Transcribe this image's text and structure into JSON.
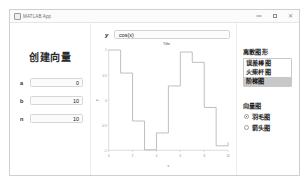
{
  "window": {
    "title": "MATLAB App",
    "icon": "app-icon",
    "controls": {
      "minimize": "–",
      "maximize": "□",
      "close": "✕"
    }
  },
  "left_panel": {
    "title": "创建向量",
    "fields": [
      {
        "label": "a",
        "value": "0"
      },
      {
        "label": "b",
        "value": "10"
      },
      {
        "label": "n",
        "value": "10"
      }
    ]
  },
  "center_panel": {
    "formula_label": "y",
    "formula_value": "cos(x)",
    "formula_placeholder": "cos(x)"
  },
  "right_panel": {
    "discrete_group": {
      "title": "离散图形",
      "items": [
        {
          "label": "误差棒图",
          "selected": false
        },
        {
          "label": "火柴杆图",
          "selected": false
        },
        {
          "label": "阶梯图",
          "selected": true
        }
      ]
    },
    "vector_group": {
      "title": "向量图",
      "options": [
        {
          "label": "羽毛图",
          "checked": true
        },
        {
          "label": "箭头图",
          "checked": false
        }
      ]
    }
  },
  "chart_data": {
    "type": "line",
    "title": "Title",
    "xlabel": "x",
    "ylabel": "y",
    "xlim": [
      0,
      10
    ],
    "ylim": [
      -1,
      1
    ],
    "xticks": [
      0,
      2,
      4,
      6,
      8,
      10
    ],
    "yticks": [
      -1,
      -0.5,
      0,
      0.5,
      1
    ],
    "xticklabels": [
      "0",
      "2",
      "4",
      "6",
      "8",
      "10"
    ],
    "yticklabels": [
      "-1",
      "-0.5",
      "0",
      "0.5",
      "1"
    ],
    "grid": false,
    "legend": null,
    "style": "stairs",
    "series": [
      {
        "name": "cos(x)",
        "x": [
          0,
          1,
          2,
          3,
          4,
          5,
          6,
          7,
          8,
          9,
          10
        ],
        "values": [
          1,
          0.54,
          -0.416,
          -0.99,
          -0.654,
          0.284,
          0.96,
          0.754,
          -0.146,
          -0.911,
          -0.839
        ],
        "color": "#b0b0b0"
      }
    ]
  }
}
